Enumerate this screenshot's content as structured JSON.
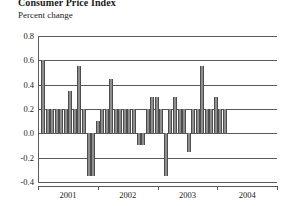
{
  "header": {
    "title": "Consumer Price Index",
    "subtitle": "Percent change"
  },
  "chart_data": {
    "type": "bar",
    "title": "Consumer Price Index",
    "subtitle": "Percent change",
    "xlabel": "",
    "ylabel": "Percent change",
    "ylim": [
      -0.4,
      0.8
    ],
    "yticks": [
      0.8,
      0.6,
      0.4,
      0.2,
      0.0,
      -0.2,
      -0.4
    ],
    "ytick_labels": [
      "0.8",
      "0.6",
      "0.4",
      "0.2",
      "0.0",
      "-0.2",
      "-0.4"
    ],
    "grid": true,
    "grid_axis": "y",
    "legend": null,
    "xlim_labels": [
      "2001",
      "2002",
      "2003",
      "2004"
    ],
    "xtick_label_positions": [
      0.5,
      1.5,
      2.5,
      3.5
    ],
    "xtick_positions": [
      0,
      1,
      2,
      3,
      4
    ],
    "bar_color": "#8e8e8e",
    "bar_edge_color": "#4d4d4d",
    "axis_color": "#5a5a5a",
    "x": [
      "2001-01",
      "2001-02",
      "2001-03",
      "2001-04",
      "2001-05",
      "2001-06",
      "2001-07",
      "2001-08",
      "2001-09",
      "2001-10",
      "2001-11",
      "2001-12",
      "2002-01",
      "2002-02",
      "2002-03",
      "2002-04",
      "2002-05",
      "2002-06",
      "2002-07",
      "2002-08",
      "2002-09",
      "2002-10",
      "2002-11",
      "2002-12",
      "2003-01",
      "2003-02",
      "2003-03",
      "2003-04",
      "2003-05",
      "2003-06",
      "2003-07",
      "2003-08",
      "2003-09",
      "2003-10",
      "2003-11",
      "2003-12",
      "2004-01",
      "2004-02",
      "2004-03",
      "2004-04",
      "2004-05"
    ],
    "values": [
      0.6,
      0.2,
      0.2,
      0.2,
      0.2,
      0.2,
      0.35,
      0.2,
      0.55,
      0.2,
      -0.35,
      -0.35,
      0.1,
      0.2,
      0.2,
      0.45,
      0.2,
      0.2,
      0.2,
      0.2,
      0.2,
      -0.1,
      -0.1,
      0.2,
      0.3,
      0.3,
      0.2,
      -0.35,
      0.2,
      0.3,
      0.2,
      0.2,
      -0.15,
      0.2,
      0.2,
      0.55,
      0.2,
      0.2,
      0.3,
      0.2,
      0.2
    ]
  }
}
